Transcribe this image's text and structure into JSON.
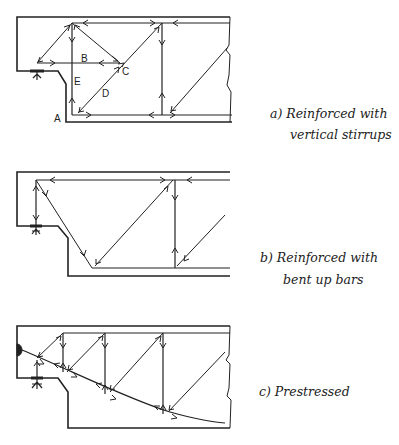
{
  "figure": {
    "panels": [
      {
        "id": "a",
        "caption_line1": "a) Reinforced with",
        "caption_line2": "vertical stirrups",
        "node_labels": {
          "A": "A",
          "B": "B",
          "C": "C",
          "D": "D",
          "E": "E"
        }
      },
      {
        "id": "b",
        "caption_line1": "b) Reinforced with",
        "caption_line2": "bent up bars"
      },
      {
        "id": "c",
        "caption_line1": "c) Prestressed"
      }
    ]
  },
  "colors": {
    "ink": "#222222",
    "thin_ink": "#444444",
    "background": "#ffffff"
  }
}
